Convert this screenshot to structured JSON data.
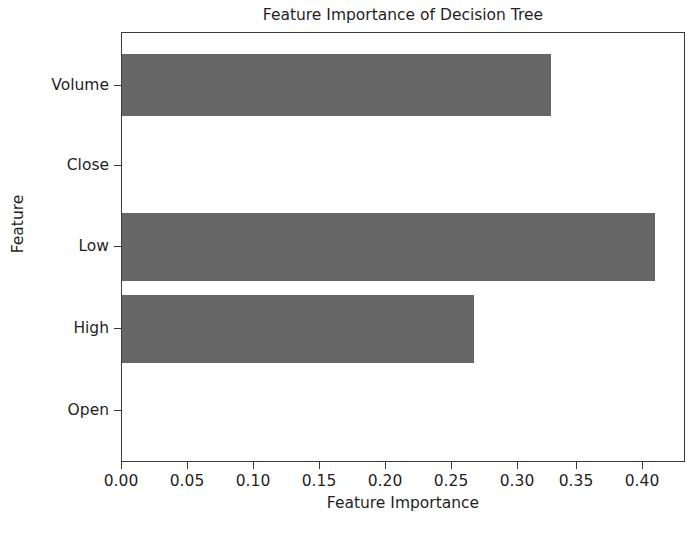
{
  "chart_data": {
    "type": "bar",
    "orientation": "horizontal",
    "title": "Feature Importance of Decision Tree",
    "xlabel": "Feature Importance",
    "ylabel": "Feature",
    "categories": [
      "Open",
      "High",
      "Low",
      "Close",
      "Volume"
    ],
    "values": [
      0.0,
      0.268,
      0.405,
      0.0,
      0.326
    ],
    "xlim": [
      0.0,
      0.4273
    ],
    "xticks": [
      0.0,
      0.05,
      0.1,
      0.15,
      0.2,
      0.25,
      0.3,
      0.35,
      0.4
    ],
    "xticklabels": [
      "0.00",
      "0.05",
      "0.10",
      "0.15",
      "0.20",
      "0.25",
      "0.30",
      "0.35",
      "0.40"
    ],
    "yticklabels": [
      "Open",
      "High",
      "Low",
      "Close",
      "Volume"
    ],
    "grid": false,
    "legend": null,
    "bar_color": "#666666",
    "frame_color": "#3a3a3a",
    "background": "#ffffff"
  }
}
